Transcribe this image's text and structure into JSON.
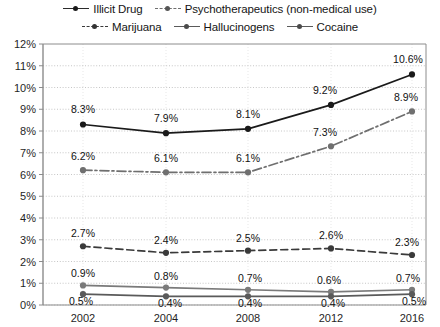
{
  "chart_data": {
    "type": "line",
    "title": "",
    "subtitle": "",
    "xlabel": "",
    "ylabel": "",
    "categories": [
      "2002",
      "2004",
      "2008",
      "2012",
      "2016"
    ],
    "ylim": [
      0,
      12
    ],
    "ytick_step": 1,
    "ytick_labels": [
      "0%",
      "1%",
      "2%",
      "3%",
      "4%",
      "5%",
      "6%",
      "7%",
      "8%",
      "9%",
      "10%",
      "11%",
      "12%"
    ],
    "grid": "horizontal-dotted",
    "legend_position": "top",
    "value_suffix": "%",
    "series": [
      {
        "name": "Illicit Drug",
        "line_style": "solid",
        "marker": "circle",
        "color": "#1a1a1a",
        "values": [
          8.3,
          7.9,
          8.1,
          9.2,
          10.6
        ],
        "labels": [
          "8.3%",
          "7.9%",
          "8.1%",
          "9.2%",
          "10.6%"
        ]
      },
      {
        "name": "Psychotherapeutics (non-medical use)",
        "line_style": "dashdot",
        "marker": "circle",
        "color": "#6f6f6f",
        "values": [
          6.2,
          6.1,
          6.1,
          7.3,
          8.9
        ],
        "labels": [
          "6.2%",
          "6.1%",
          "6.1%",
          "7.3%",
          "8.9%"
        ]
      },
      {
        "name": "Marijuana",
        "line_style": "dashed",
        "marker": "circle",
        "color": "#3a3a3a",
        "values": [
          2.7,
          2.4,
          2.5,
          2.6,
          2.3
        ],
        "labels": [
          "2.7%",
          "2.4%",
          "2.5%",
          "2.6%",
          "2.3%"
        ]
      },
      {
        "name": "Hallucinogens",
        "line_style": "solid",
        "marker": "circle",
        "color": "#7a7a7a",
        "values": [
          0.9,
          0.8,
          0.7,
          0.6,
          0.7
        ],
        "labels": [
          "0.9%",
          "0.8%",
          "0.7%",
          "0.6%",
          "0.7%"
        ]
      },
      {
        "name": "Cocaine",
        "line_style": "solid",
        "marker": "circle",
        "color": "#5a5a5a",
        "values": [
          0.5,
          0.4,
          0.4,
          0.4,
          0.5
        ],
        "labels": [
          "0.5%",
          "0.4%",
          "0.4%",
          "0.4%",
          "0.5%"
        ]
      }
    ]
  },
  "legend": {
    "row1": [
      {
        "label": "Illicit Drug"
      },
      {
        "label": "Psychotherapeutics (non-medical use)"
      }
    ],
    "row2": [
      {
        "label": "Marijuana"
      },
      {
        "label": "Hallucinogens"
      },
      {
        "label": "Cocaine"
      }
    ]
  },
  "colors": {
    "axis": "#8c8c8c",
    "grid": "#b8b8b8",
    "text": "#1a1a1a"
  }
}
